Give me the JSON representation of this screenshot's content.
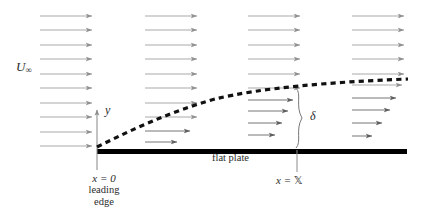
{
  "figure": {
    "background_color": "#ffffff",
    "width": 423,
    "height": 222
  },
  "labels": {
    "freestream_symbol": "U",
    "freestream_subscript": "∞",
    "vertical_axis": "y",
    "boundary_thickness": "δ",
    "plate": "flat plate",
    "origin_equation": "x = 0",
    "leading_line1": "leading",
    "leading_line2": "edge",
    "station_prefix": "x = ",
    "station_value": "𝕏"
  },
  "colors": {
    "arrow": "#9a9a9a",
    "arrow_dark": "#6e6e6e",
    "plate": "#000000",
    "boundary_layer": "#111111",
    "axis": "#8c8c8c",
    "text": "#2b2b2b",
    "brace": "#777777"
  },
  "geometry": {
    "plate": {
      "x1": 97,
      "x2": 407,
      "y": 149,
      "thickness": 5
    },
    "y_axis": {
      "x": 97,
      "y_top": 110,
      "y_bottom": 170
    },
    "station_tick": {
      "x": 297,
      "y_top": 150,
      "y_bottom": 172
    },
    "boundary_curve": "M 97 147 C 135 128, 170 112, 215 99 C 260 88, 330 82, 408 79",
    "brace": {
      "x": 297,
      "y_top": 88,
      "y_bottom": 148,
      "label_x": 310,
      "label_y": 116
    }
  },
  "chart_data": {
    "type": "diagram",
    "columns": [
      {
        "name": "column-1-uniform-freestream",
        "x_start": 40,
        "x_end": 92,
        "arrows": [
          {
            "y": 16,
            "x_start": 40,
            "x_end": 92
          },
          {
            "y": 30,
            "x_start": 40,
            "x_end": 92
          },
          {
            "y": 45,
            "x_start": 40,
            "x_end": 92
          },
          {
            "y": 59,
            "x_start": 40,
            "x_end": 92
          },
          {
            "y": 74,
            "x_start": 40,
            "x_end": 92
          },
          {
            "y": 88,
            "x_start": 40,
            "x_end": 92
          },
          {
            "y": 103,
            "x_start": 40,
            "x_end": 92
          },
          {
            "y": 117,
            "x_start": 40,
            "x_end": 92
          },
          {
            "y": 132,
            "x_start": 40,
            "x_end": 92
          },
          {
            "y": 146,
            "x_start": 40,
            "x_end": 92
          }
        ]
      },
      {
        "name": "column-2-developing-profile",
        "x_start": 145,
        "x_end": 197,
        "arrows": [
          {
            "y": 16,
            "x_start": 145,
            "x_end": 197
          },
          {
            "y": 30,
            "x_start": 145,
            "x_end": 197
          },
          {
            "y": 45,
            "x_start": 145,
            "x_end": 197
          },
          {
            "y": 59,
            "x_start": 145,
            "x_end": 197
          },
          {
            "y": 74,
            "x_start": 145,
            "x_end": 197
          },
          {
            "y": 88,
            "x_start": 145,
            "x_end": 197
          },
          {
            "y": 103,
            "x_start": 145,
            "x_end": 197
          },
          {
            "y": 117,
            "x_start": 145,
            "x_end": 197
          },
          {
            "y": 131,
            "x_start": 145,
            "x_end": 190
          },
          {
            "y": 142,
            "x_start": 145,
            "x_end": 177
          }
        ]
      },
      {
        "name": "column-3-profile-at-station-X",
        "x_start": 248,
        "x_end": 300,
        "arrows": [
          {
            "y": 16,
            "x_start": 248,
            "x_end": 300
          },
          {
            "y": 30,
            "x_start": 248,
            "x_end": 300
          },
          {
            "y": 45,
            "x_start": 248,
            "x_end": 300
          },
          {
            "y": 59,
            "x_start": 248,
            "x_end": 300
          },
          {
            "y": 74,
            "x_start": 248,
            "x_end": 300
          },
          {
            "y": 88,
            "x_start": 248,
            "x_end": 300
          },
          {
            "y": 100,
            "x_start": 248,
            "x_end": 293
          },
          {
            "y": 111,
            "x_start": 248,
            "x_end": 288
          },
          {
            "y": 123,
            "x_start": 248,
            "x_end": 282
          },
          {
            "y": 135,
            "x_start": 248,
            "x_end": 275
          }
        ]
      },
      {
        "name": "column-4-thicker-profile",
        "x_start": 352,
        "x_end": 404,
        "arrows": [
          {
            "y": 16,
            "x_start": 352,
            "x_end": 404
          },
          {
            "y": 30,
            "x_start": 352,
            "x_end": 404
          },
          {
            "y": 45,
            "x_start": 352,
            "x_end": 404
          },
          {
            "y": 59,
            "x_start": 352,
            "x_end": 404
          },
          {
            "y": 74,
            "x_start": 352,
            "x_end": 404
          },
          {
            "y": 85,
            "x_start": 352,
            "x_end": 402
          },
          {
            "y": 98,
            "x_start": 352,
            "x_end": 396
          },
          {
            "y": 110,
            "x_start": 352,
            "x_end": 390
          },
          {
            "y": 123,
            "x_start": 352,
            "x_end": 382
          },
          {
            "y": 136,
            "x_start": 352,
            "x_end": 372
          }
        ]
      }
    ]
  }
}
